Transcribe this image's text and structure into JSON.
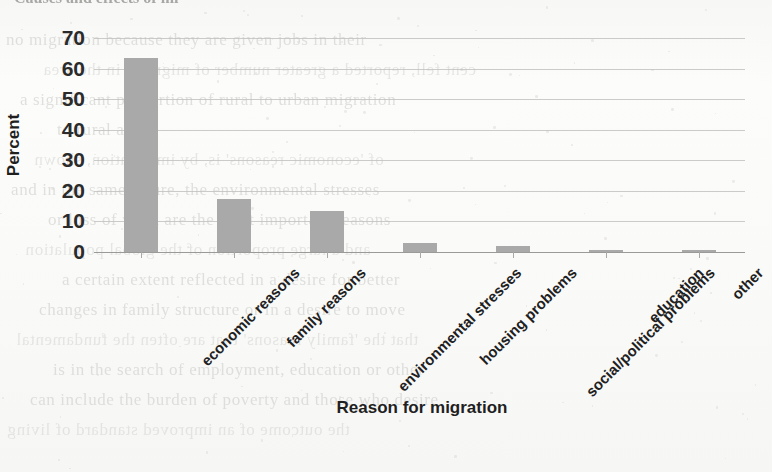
{
  "page": {
    "cropped_heading": "Causes and effects of mi",
    "bleed_through_lines": [
      "no migration because they are given jobs in their",
      "cent fell, reported a greater number of migrants in the area",
      "a significant proportion of rural to urban migration",
      "to rural areas",
      "of 'economic reasons' is, by implication, shown",
      "and in the same figure, the environmental stresses",
      "or loss of work are the most important reasons",
      "and a large proportion of the global population",
      "a certain extent reflected in a desire for better",
      "changes in family structure or in a desire to move",
      "that the 'family reasons' that are often the fundamental",
      "is in the search of employment, education or other",
      "can include the burden of poverty and those who desire",
      "the outcome of an improved standard of living"
    ]
  },
  "chart_data": {
    "type": "bar",
    "title": "",
    "xlabel": "Reason for migration",
    "ylabel": "Percent",
    "ylim": [
      0,
      70
    ],
    "yticks": [
      70,
      60,
      50,
      40,
      30,
      20,
      10,
      0
    ],
    "grid": true,
    "legend": "none",
    "bar_color": "#a9a9a9",
    "categories": [
      "economic reasons",
      "family reasons",
      "environmental stresses",
      "housing problems",
      "social/political problems",
      "education",
      "other"
    ],
    "values": [
      63.5,
      17.5,
      13.3,
      3.0,
      2.0,
      0.7,
      0.6
    ],
    "units": "%"
  }
}
